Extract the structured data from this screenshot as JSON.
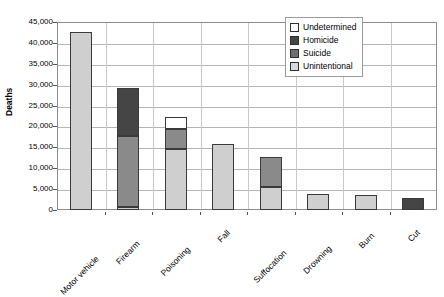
{
  "chart_data": {
    "type": "bar",
    "title": "",
    "subtitle": "",
    "xlabel": "",
    "ylabel": "Deaths",
    "stacked": true,
    "grid": true,
    "legend_position": "top-right",
    "ylim": [
      0,
      45000
    ],
    "ytick_step": 5000,
    "ytick_labels": [
      "0",
      "5,000",
      "10,000",
      "15,000",
      "20,000",
      "25,000",
      "30,000",
      "35,000",
      "40,000",
      "45,000"
    ],
    "ytick_values": [
      0,
      5000,
      10000,
      15000,
      20000,
      25000,
      30000,
      35000,
      40000,
      45000
    ],
    "categories": [
      "Motor vehicle",
      "Firearm",
      "Poisoning",
      "Fall",
      "Suffocation",
      "Drowning",
      "Burn",
      "Cut"
    ],
    "series": [
      {
        "name": "Unintentional",
        "color": "#cfcfcf",
        "values": [
          42500,
          700,
          14500,
          15800,
          5500,
          3800,
          3700,
          0
        ]
      },
      {
        "name": "Suicide",
        "color": "#8a8a8a",
        "values": [
          0,
          17000,
          4800,
          0,
          7200,
          0,
          0,
          0
        ]
      },
      {
        "name": "Homicide",
        "color": "#454545",
        "values": [
          0,
          11500,
          0,
          0,
          0,
          0,
          0,
          2800
        ]
      },
      {
        "name": "Undetermined",
        "color": "#ffffff",
        "values": [
          0,
          0,
          2900,
          0,
          0,
          0,
          0,
          0
        ]
      }
    ],
    "totals": [
      42500,
      29200,
      22200,
      15800,
      12700,
      3800,
      3700,
      2800
    ]
  },
  "legend": {
    "items": [
      {
        "label": "Undetermined",
        "color": "#ffffff"
      },
      {
        "label": "Homicide",
        "color": "#454545"
      },
      {
        "label": "Suicide",
        "color": "#6e6e6e"
      },
      {
        "label": "Unintentional",
        "color": "#d8d8d8"
      }
    ]
  },
  "axis": {
    "y_title": "Deaths"
  }
}
